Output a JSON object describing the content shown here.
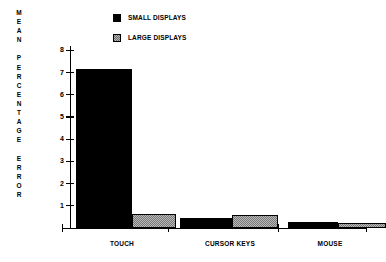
{
  "chart_data": {
    "type": "bar",
    "title": "",
    "xlabel": "",
    "ylabel": "MEAN\nPERCENTAGE\nERROR",
    "ylabel_stacked": "M\nE\nA\nN\n\nP\nE\nR\nC\nE\nN\nT\nA\nG\nE\n\nE\nR\nR\nO\nR",
    "categories": [
      "TOUCH",
      "CURSOR KEYS",
      "MOUSE"
    ],
    "series": [
      {
        "name": "SMALL DISPLAYS",
        "color": "#000000",
        "values": [
          7.15,
          0.45,
          0.25
        ]
      },
      {
        "name": "LARGE DISPLAYS",
        "color": "#b9b9b9",
        "values": [
          0.65,
          0.6,
          0.22
        ]
      }
    ],
    "ylim": [
      0,
      8
    ],
    "yticks": [
      1,
      2,
      3,
      4,
      5,
      6,
      7,
      8
    ],
    "ytick_labels": [
      "1",
      "2",
      "3",
      "4",
      "5",
      "6",
      "7",
      "8"
    ],
    "grid": false,
    "legend_position": "top-center"
  },
  "legend": {
    "entries": [
      {
        "label": "SMALL DISPLAYS",
        "swatch": "black-square-icon"
      },
      {
        "label": "LARGE DISPLAYS",
        "swatch": "gray-hatched-square-icon"
      }
    ]
  },
  "axis": {
    "y_title_lines": "M\nE\nA\nN\n \nP\nE\nR\nC\nE\nN\nT\nA\nG\nE\n \nE\nR\nR\nO\nR",
    "y_tick_labels": [
      "8",
      "7",
      "6",
      "5",
      "4",
      "3",
      "2",
      "1"
    ],
    "x_tick_labels": [
      "TOUCH",
      "CURSOR KEYS",
      "MOUSE"
    ]
  }
}
